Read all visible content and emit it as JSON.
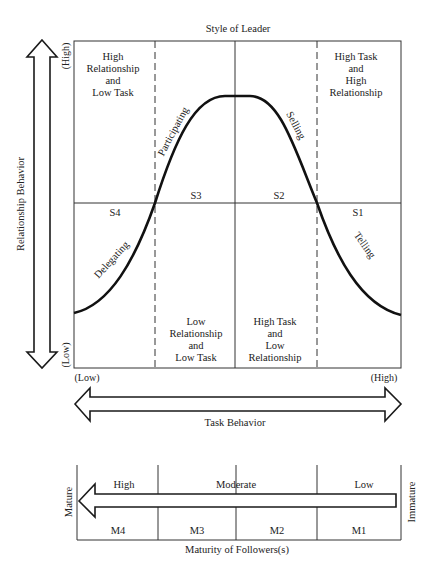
{
  "title": "Style of Leader",
  "y_axis": {
    "label": "Relationship Behavior",
    "high": "(High)",
    "low": "(Low)"
  },
  "x_axis": {
    "label": "Task Behavior",
    "high": "(High)",
    "low": "(Low)"
  },
  "quadrants": {
    "top_left": [
      "High",
      "Relationship",
      "and",
      "Low Task"
    ],
    "top_right": [
      "High Task",
      "and",
      "High",
      "Relationship"
    ],
    "bottom_left": [
      "Low",
      "Relationship",
      "and",
      "Low Task"
    ],
    "bottom_right": [
      "High Task",
      "and",
      "Low",
      "Relationship"
    ]
  },
  "styles": [
    {
      "code": "S1",
      "name": "Telling"
    },
    {
      "code": "S2",
      "name": "Selling"
    },
    {
      "code": "S3",
      "name": "Participating"
    },
    {
      "code": "S4",
      "name": "Delegating"
    }
  ],
  "maturity": {
    "title": "Maturity of Followers(s)",
    "left_end": "Mature",
    "right_end": "Immature",
    "levels": [
      "High",
      "Moderate",
      "Low"
    ],
    "stages": [
      "M4",
      "M3",
      "M2",
      "M1"
    ]
  },
  "colors": {
    "ink": "#1a1a1a",
    "grid": "#333333",
    "background": "#ffffff"
  }
}
